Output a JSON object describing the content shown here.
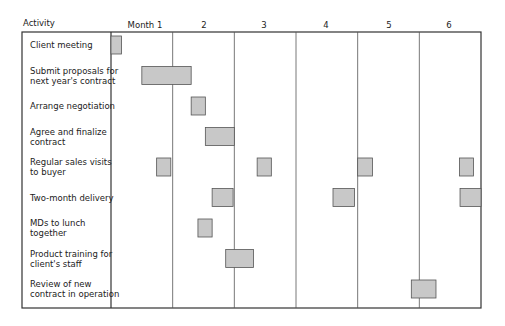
{
  "chart_data": {
    "type": "gantt",
    "title": "",
    "header_label": "Activity",
    "column_labels": [
      "Month 1",
      "2",
      "3",
      "4",
      "5",
      "6"
    ],
    "x_unit": "months",
    "xlim": [
      0,
      6
    ],
    "activities": [
      {
        "name": "Client meeting",
        "lines": [
          "Client meeting"
        ],
        "bars": [
          [
            0.0,
            0.17
          ]
        ]
      },
      {
        "name": "Submit proposals for next year's contract",
        "lines": [
          "Submit proposals for",
          "next year's contract"
        ],
        "bars": [
          [
            0.5,
            1.3
          ]
        ]
      },
      {
        "name": "Arrange negotiation",
        "lines": [
          "Arrange negotiation"
        ],
        "bars": [
          [
            1.3,
            1.53
          ]
        ]
      },
      {
        "name": "Agree and finalize contract",
        "lines": [
          "Agree and finalize",
          "contract"
        ],
        "bars": [
          [
            1.53,
            2.0
          ]
        ]
      },
      {
        "name": "Regular sales visits to buyer",
        "lines": [
          "Regular sales visits",
          "to buyer"
        ],
        "bars": [
          [
            0.74,
            0.97
          ],
          [
            2.37,
            2.6
          ],
          [
            4.0,
            4.24
          ],
          [
            5.65,
            5.88
          ]
        ]
      },
      {
        "name": "Two-month delivery",
        "lines": [
          "Two-month delivery"
        ],
        "bars": [
          [
            1.64,
            1.98
          ],
          [
            3.6,
            3.95
          ],
          [
            5.66,
            6.0
          ]
        ]
      },
      {
        "name": "MDs to lunch together",
        "lines": [
          "MDs to lunch",
          "together"
        ],
        "bars": [
          [
            1.41,
            1.64
          ]
        ]
      },
      {
        "name": "Product training for client's staff",
        "lines": [
          "Product training for",
          "client's staff"
        ],
        "bars": [
          [
            1.86,
            2.31
          ]
        ]
      },
      {
        "name": "Review of new contract in operation",
        "lines": [
          "Review of new",
          "contract in operation"
        ],
        "bars": [
          [
            4.87,
            5.27
          ]
        ]
      }
    ],
    "colors": {
      "bar_fill": "#c8c8c8",
      "bar_stroke": "#555555",
      "grid": "#555555",
      "border": "#333333"
    }
  }
}
